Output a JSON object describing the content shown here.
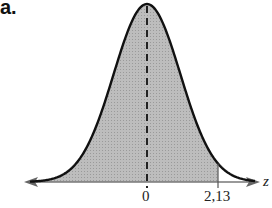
{
  "part_label": "a.",
  "chart_data": {
    "type": "area",
    "distribution": "standard normal",
    "mean": 0,
    "shaded_region": {
      "from": "-infinity",
      "to": 2.13
    },
    "tick_labels": [
      "0",
      "2,13"
    ],
    "xlabel": "z",
    "mean_line": "dashed",
    "colors": {
      "curve": "#111111",
      "fill": "#b8b8b8",
      "axis": "#777777"
    }
  },
  "axis": {
    "zero_label": "0",
    "bound_label": "2,13",
    "variable": "z"
  }
}
